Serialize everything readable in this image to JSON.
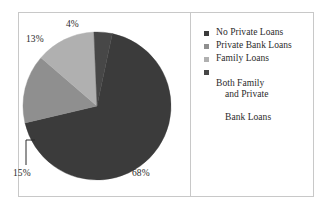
{
  "chart_data": {
    "type": "pie",
    "title": "",
    "categories": [
      "No Private Loans",
      "Private Bank Loans",
      "Family Loans",
      "Both Family and Private Bank Loans"
    ],
    "values": [
      68,
      15,
      13,
      4
    ],
    "value_labels": [
      "68%",
      "15%",
      "13%",
      "4%"
    ],
    "unit": "%",
    "legend_position": "right",
    "grid": false,
    "colors": [
      "#3b3b3b",
      "#8f8f8f",
      "#b0b0b0",
      "#474747"
    ],
    "slices": [
      {
        "label": "No Private Loans",
        "value": 68,
        "display": "68%",
        "color": "#3b3b3b"
      },
      {
        "label": "Private Bank Loans",
        "value": 15,
        "display": "15%",
        "color": "#8f8f8f"
      },
      {
        "label": "Family Loans",
        "value": 13,
        "display": "13%",
        "color": "#b0b0b0"
      },
      {
        "label": "Both Family and Private Bank Loans",
        "value": 4,
        "display": "4%",
        "color": "#474747"
      }
    ]
  },
  "pie": {
    "label_68": "68%",
    "label_15": "15%",
    "label_13": "13%",
    "label_4": "4%"
  },
  "legend": {
    "items": [
      {
        "swatch_color": "#3b3b3b",
        "label": "No Private Loans",
        "continuation": ""
      },
      {
        "swatch_color": "#8f8f8f",
        "label": "Private Bank Loans",
        "continuation": ""
      },
      {
        "swatch_color": "#b0b0b0",
        "label": "Family Loans",
        "continuation": ""
      },
      {
        "swatch_color": "#474747",
        "label": "Both Family",
        "continuation_1": "and Private",
        "continuation_2": "Bank Loans"
      }
    ]
  },
  "style": {
    "border_color": "#c8c8c8",
    "background": "#ffffff",
    "text_color": "#2b2b2b"
  }
}
